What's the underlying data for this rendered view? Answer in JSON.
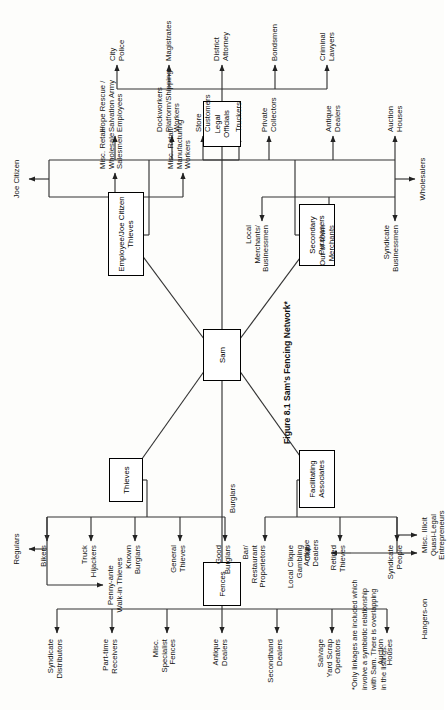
{
  "figure": {
    "caption": "Figure 8.1 Sam's Fencing Network*",
    "footnote": "*Only linkages are included which\ninvolve a symbiotic relationship\nwith Sam. There is overlapping\nin the listings."
  },
  "center": {
    "label": "Sam"
  },
  "nodes": {
    "fences": "Fences",
    "thieves": "Thieves",
    "employee_joe_citizen_thieves": "Employee/Joe Citizen\nThieves",
    "legal_officials": "Legal\nOfficials",
    "facilitating_associates": "Facilitating\nAssociates",
    "secondary_purchasers": "Secondary\nPurchasers"
  },
  "branches": [
    {
      "id": "fences",
      "node": "Fences",
      "group_labels": [],
      "items": [
        "Auction\nHouses",
        "Salvage\nYard Scrap\nOperators",
        "Secondhand\nDealers",
        "Antique\nDealers",
        "Misc.\nSpecialist\nFences",
        "Part-time\nReceivers",
        "Syndicate\nDistributors"
      ]
    },
    {
      "id": "thieves",
      "node": "Thieves",
      "group_labels": [
        "Burglars",
        "Regulars",
        "Penny-ante\nWalk-in Thieves"
      ],
      "items": [
        "Good\nBurglars",
        "General\nThieves",
        "Known\nBurglars",
        "Truck\nHijackers",
        "Bikers"
      ]
    },
    {
      "id": "employee_joe_citizen",
      "node": "Employee/Joe Citizen\nThieves",
      "group_labels": [
        "Joe Citizen",
        "Truckers"
      ],
      "items_upper": [
        "Misc. Retail/\nManufacturing\nWorkers",
        "Misc. Retail/\nWholesale\nSalesmen"
      ],
      "items_lower": [
        "Dockworkers\nPlatform/Shipping\nWorkers",
        "Hope Rescue /\nSalvation Army\nEmployees"
      ]
    },
    {
      "id": "legal_officials",
      "node": "Legal\nOfficials",
      "group_labels": [],
      "items": [
        "Criminal\nLawyers",
        "Bondsmen",
        "District\nAttorney",
        "Magistrates",
        "City\nPolice"
      ]
    },
    {
      "id": "facilitating_associates",
      "node": "Facilitating\nAssociates",
      "group_labels": [
        "Hangers-on"
      ],
      "items_upper": [
        "Syndicate\nPeople",
        "Retired\nThieves",
        "Local Clique\nGambling\nClub",
        "Bar/\nRestaurant\nProperietors"
      ],
      "items_lower": [
        "Misc. Illicit\nQuasi-Legal\nEntrepreneurs",
        "Antique\nDealers"
      ]
    },
    {
      "id": "secondary_purchasers",
      "node": "Secondary\nPurchasers",
      "group_labels": [
        "Wholesalers"
      ],
      "items_upper": [
        "Syndicate\nBusinessmen",
        "Out-of-town\nMerchants",
        "Local\nMerchants/\nBusinessmen"
      ],
      "items_lower": [
        "Auction\nHouses",
        "Antique\nDealers",
        "Private\nCollectors",
        "Store\nCustomers"
      ]
    }
  ],
  "colors": {
    "ink": "#111111",
    "line": "#333333",
    "paper": "#fdfdfb"
  }
}
